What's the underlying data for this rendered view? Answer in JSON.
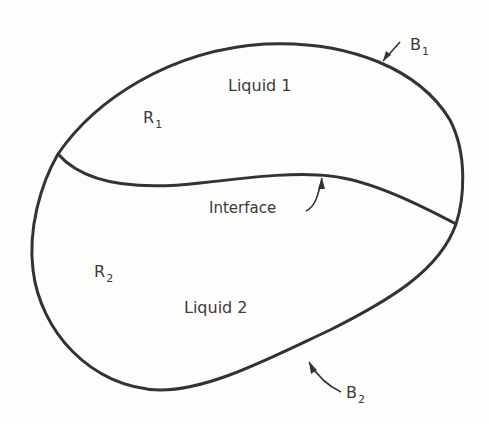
{
  "diagram": {
    "labels": {
      "liquid1": "Liquid 1",
      "liquid2": "Liquid 2",
      "r1": {
        "main": "R",
        "sub": "1"
      },
      "r2": {
        "main": "R",
        "sub": "2"
      },
      "b1": {
        "main": "B",
        "sub": "1"
      },
      "b2": {
        "main": "B",
        "sub": "2"
      },
      "interface": "Interface"
    },
    "colors": {
      "stroke": "#333333",
      "text": "#3a3a3a",
      "background": "#fdfdfc"
    }
  }
}
